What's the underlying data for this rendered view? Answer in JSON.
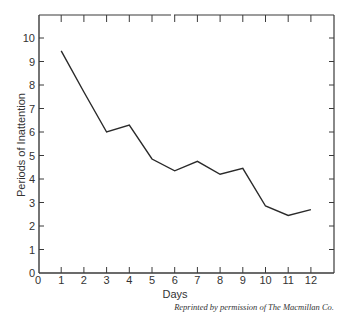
{
  "chart_data": {
    "type": "line",
    "title": "",
    "xlabel": "Days",
    "ylabel": "Periods of Inattention",
    "x": [
      1,
      2,
      3,
      4,
      5,
      6,
      7,
      8,
      9,
      10,
      11,
      12
    ],
    "series": [
      {
        "name": "Periods of Inattention",
        "values": [
          9.45,
          7.7,
          6.0,
          6.3,
          4.85,
          4.35,
          4.75,
          4.2,
          4.45,
          2.85,
          2.45,
          2.7
        ]
      }
    ],
    "x_ticks": [
      "0",
      "1",
      "2",
      "3",
      "4",
      "5",
      "6",
      "7",
      "8",
      "9",
      "10",
      "11",
      "12"
    ],
    "y_ticks": [
      "0",
      "1",
      "2",
      "3",
      "4",
      "5",
      "6",
      "7",
      "8",
      "9",
      "10"
    ],
    "xlim": [
      0,
      13
    ],
    "ylim": [
      0,
      11
    ],
    "grid": false,
    "legend": "none"
  },
  "caption": "Reprinted by permission of The Macmillan Co.",
  "colors": {
    "line": "#2a2a2a",
    "frame": "#3a3a3a",
    "background": "#ffffff"
  }
}
